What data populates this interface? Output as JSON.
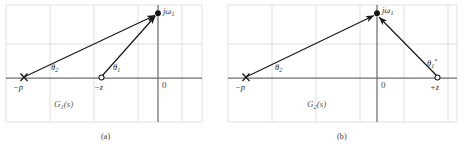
{
  "figure": {
    "type": "complex-plane-pole-zero-diagram",
    "panels": [
      {
        "id": "a",
        "caption": "(a)",
        "system_label": "G",
        "system_sub": "1",
        "system_tail": "(s)",
        "origin_label": "0",
        "vector_tip_label": "jω",
        "vector_tip_sub": "1",
        "pole_label": "−p",
        "zero_label": "−z",
        "angle_pole_label": "θ",
        "angle_pole_sub": "2",
        "angle_zero_label": "θ",
        "angle_zero_sub": "1",
        "angle_zero_sup": "",
        "points": {
          "pole": {
            "x": -3.0,
            "y": 0.0,
            "marker": "cross"
          },
          "zero": {
            "x": -1.3,
            "y": 0.0,
            "marker": "open-circle"
          },
          "test_point": {
            "x": 0.0,
            "y": 1.8,
            "marker": "filled-circle"
          },
          "origin": {
            "x": 0.0,
            "y": 0.0
          }
        },
        "vectors": [
          {
            "name": "pole-vector",
            "from": "pole",
            "to": "test_point",
            "angle_label": "theta2"
          },
          {
            "name": "zero-vector",
            "from": "zero",
            "to": "test_point",
            "angle_label": "theta1"
          }
        ]
      },
      {
        "id": "b",
        "caption": "(b)",
        "system_label": "G",
        "system_sub": "2",
        "system_tail": "(s)",
        "origin_label": "0",
        "vector_tip_label": "jω",
        "vector_tip_sub": "1",
        "pole_label": "−p",
        "zero_label": "+z",
        "angle_pole_label": "θ",
        "angle_pole_sub": "2",
        "angle_zero_label": "θ",
        "angle_zero_sub": "1",
        "angle_zero_sup": "*",
        "points": {
          "pole": {
            "x": -3.0,
            "y": 0.0,
            "marker": "cross"
          },
          "zero": {
            "x": 1.35,
            "y": 0.0,
            "marker": "open-circle"
          },
          "test_point": {
            "x": 0.0,
            "y": 1.8,
            "marker": "filled-circle"
          },
          "origin": {
            "x": 0.0,
            "y": 0.0
          }
        },
        "vectors": [
          {
            "name": "pole-vector",
            "from": "pole",
            "to": "test_point",
            "angle_label": "theta2"
          },
          {
            "name": "zero-vector",
            "from": "zero",
            "to": "test_point",
            "angle_label": "theta1star"
          }
        ]
      }
    ],
    "colors": {
      "grid": "#d8d8d8",
      "axis": "#6f6f6f",
      "vector": "#1b1b1b",
      "marker": "#1b1b1b",
      "text": "#3a3a3a",
      "background": "#ffffff"
    },
    "grid": {
      "visible": true,
      "panel_a": {
        "left": 6,
        "right": 202,
        "top": 5,
        "bottom": 122,
        "v_lines": [
          6,
          50,
          94,
          138,
          182,
          202
        ],
        "h_lines": [
          5,
          44,
          78,
          122
        ]
      },
      "panel_b": {
        "left": 228,
        "right": 457,
        "top": 5,
        "bottom": 122,
        "v_lines": [
          228,
          272,
          316,
          360,
          404,
          448
        ],
        "h_lines": [
          5,
          44,
          78,
          122
        ]
      }
    }
  }
}
